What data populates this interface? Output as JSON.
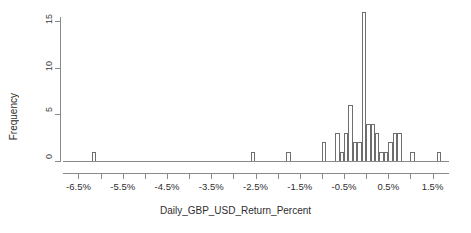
{
  "chart_data": {
    "type": "bar",
    "title": "",
    "subtitle": "",
    "xlabel": "Daily_GBP_USD_Return_Percent",
    "ylabel": "Frequency",
    "grid": false,
    "legend": null,
    "bin_width": 0.1,
    "xlim": [
      -6.85,
      1.85
    ],
    "ylim": [
      0,
      16
    ],
    "x_tick_labels": [
      "-6.5%",
      "-5.5%",
      "-4.5%",
      "-3.5%",
      "-2.5%",
      "-1.5%",
      "-0.5%",
      "0.5%",
      "1.5%"
    ],
    "x_tick_values": [
      -6.5,
      -5.5,
      -4.5,
      -3.5,
      -2.5,
      -1.5,
      -0.5,
      0.5,
      1.5
    ],
    "x_minor_tick_values": [
      -6.0,
      -5.0,
      -4.0,
      -3.0,
      -2.0,
      -1.0,
      0.0,
      1.0
    ],
    "y_tick_labels": [
      "0",
      "5",
      "10",
      "15"
    ],
    "y_tick_values": [
      0,
      5,
      10,
      15
    ],
    "bins": [
      {
        "x_left": -6.2,
        "x_right": -6.1,
        "center": -6.15,
        "value": 1
      },
      {
        "x_left": -2.6,
        "x_right": -2.5,
        "center": -2.55,
        "value": 1
      },
      {
        "x_left": -1.8,
        "x_right": -1.7,
        "center": -1.75,
        "value": 1
      },
      {
        "x_left": -1.0,
        "x_right": -0.9,
        "center": -0.95,
        "value": 2
      },
      {
        "x_left": -0.7,
        "x_right": -0.6,
        "center": -0.65,
        "value": 3
      },
      {
        "x_left": -0.6,
        "x_right": -0.5,
        "center": -0.55,
        "value": 1
      },
      {
        "x_left": -0.5,
        "x_right": -0.4,
        "center": -0.45,
        "value": 3
      },
      {
        "x_left": -0.4,
        "x_right": -0.3,
        "center": -0.35,
        "value": 6
      },
      {
        "x_left": -0.3,
        "x_right": -0.2,
        "center": -0.25,
        "value": 2
      },
      {
        "x_left": -0.2,
        "x_right": -0.1,
        "center": -0.15,
        "value": 2
      },
      {
        "x_left": -0.1,
        "x_right": 0.0,
        "center": -0.05,
        "value": 16
      },
      {
        "x_left": 0.0,
        "x_right": 0.1,
        "center": 0.05,
        "value": 4
      },
      {
        "x_left": 0.1,
        "x_right": 0.2,
        "center": 0.15,
        "value": 4
      },
      {
        "x_left": 0.2,
        "x_right": 0.3,
        "center": 0.25,
        "value": 3
      },
      {
        "x_left": 0.3,
        "x_right": 0.4,
        "center": 0.35,
        "value": 1
      },
      {
        "x_left": 0.4,
        "x_right": 0.5,
        "center": 0.45,
        "value": 1
      },
      {
        "x_left": 0.5,
        "x_right": 0.6,
        "center": 0.55,
        "value": 2
      },
      {
        "x_left": 0.6,
        "x_right": 0.7,
        "center": 0.65,
        "value": 3
      },
      {
        "x_left": 0.7,
        "x_right": 0.8,
        "center": 0.75,
        "value": 3
      },
      {
        "x_left": 1.0,
        "x_right": 1.1,
        "center": 1.05,
        "value": 1
      },
      {
        "x_left": 1.6,
        "x_right": 1.7,
        "center": 1.65,
        "value": 1
      }
    ],
    "colors": {
      "bar_stroke": "#6e6e6e",
      "bar_fill": "transparent",
      "axis": "#8a8a8a",
      "text": "#2e2e2e",
      "background": "#ffffff"
    }
  }
}
